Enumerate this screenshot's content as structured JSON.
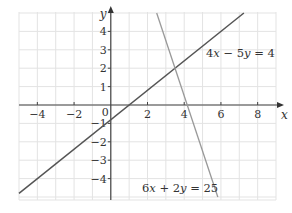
{
  "chart_data": {
    "type": "line",
    "title": "",
    "xlabel": "x",
    "ylabel": "y",
    "xlim": [
      -5,
      9
    ],
    "ylim": [
      -5,
      5
    ],
    "grid": true,
    "x_ticks": [
      -4,
      -2,
      2,
      4,
      6,
      8
    ],
    "y_ticks": [
      -4,
      -3,
      -2,
      -1,
      1,
      2,
      3,
      4
    ],
    "origin_label": "0",
    "series": [
      {
        "name": "4x − 5y = 4",
        "equation": {
          "a": 4,
          "b": -5,
          "c": 4
        },
        "color": "#555555",
        "x": [
          -5,
          7.25
        ],
        "y": [
          -4.8,
          5
        ]
      },
      {
        "name": "6x + 2y = 25",
        "equation": {
          "a": 6,
          "b": 2,
          "c": 25
        },
        "color": "#999999",
        "x": [
          2.5,
          5.83
        ],
        "y": [
          5,
          -5
        ]
      }
    ],
    "annotations": [
      {
        "text": "4x − 5y = 4",
        "x": 5.2,
        "y": 2.5
      },
      {
        "text": "6x + 2y = 25",
        "x": 1.5,
        "y": -5.5
      }
    ],
    "intersection": {
      "x": 3.62,
      "y": 2.1
    }
  },
  "labels": {
    "x_axis": "x",
    "y_axis": "y",
    "origin": "0",
    "eq1": "4x − 5y = 4",
    "eq2": "6x + 2y = 25"
  }
}
